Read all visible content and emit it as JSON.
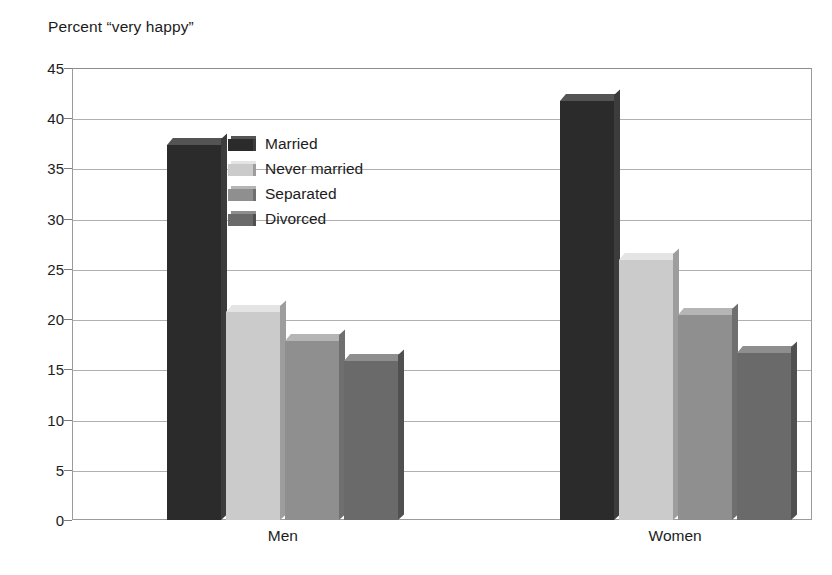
{
  "chart_data": {
    "type": "bar",
    "title": "Percent “very happy”",
    "xlabel": "",
    "ylabel": "",
    "ylim": [
      0,
      45
    ],
    "ytick_step": 5,
    "yticks": [
      "45",
      "40",
      "35",
      "30",
      "25",
      "20",
      "15",
      "10",
      "5",
      "0"
    ],
    "grid": true,
    "legend_position": "inside-upper-left",
    "categories": [
      "Men",
      "Women"
    ],
    "series": [
      {
        "name": "Married",
        "values": [
          37.3,
          41.7
        ],
        "color": "#2b2b2b",
        "top_color": "#545454",
        "side_color": "#3c3c3c"
      },
      {
        "name": "Never married",
        "values": [
          20.7,
          25.9
        ],
        "color": "#cbcbcb",
        "top_color": "#e4e4e4",
        "side_color": "#9d9d9d"
      },
      {
        "name": "Separated",
        "values": [
          17.8,
          20.4
        ],
        "color": "#8f8f8f",
        "top_color": "#b5b5b5",
        "side_color": "#6f6f6f"
      },
      {
        "name": "Divorced",
        "values": [
          15.8,
          16.6
        ],
        "color": "#6a6a6a",
        "top_color": "#8e8e8e",
        "side_color": "#505050"
      }
    ]
  },
  "legend": {
    "items": [
      {
        "label": "Married"
      },
      {
        "label": "Never married"
      },
      {
        "label": "Separated"
      },
      {
        "label": "Divorced"
      }
    ]
  },
  "axis": {
    "x_group_labels": [
      "Men",
      "Women"
    ]
  }
}
